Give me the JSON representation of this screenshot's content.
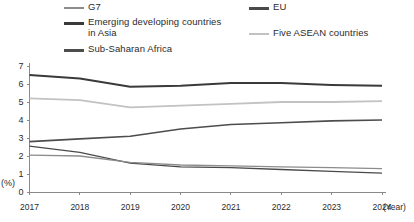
{
  "legend": {
    "items": [
      {
        "key": "g7",
        "label": "G7",
        "color": "#8c8c8c",
        "weight": "thin"
      },
      {
        "key": "asia",
        "label": "Emerging developing countries\nin Asia",
        "color": "#3a3a3a",
        "weight": "thick"
      },
      {
        "key": "ssa",
        "label": "Sub-Saharan Africa",
        "color": "#4d4d4d",
        "weight": "thick"
      },
      {
        "key": "eu",
        "label": "EU",
        "color": "#4a4a4a",
        "weight": "thin"
      },
      {
        "key": "asean",
        "label": "Five ASEAN countries",
        "color": "#c2c2c2",
        "weight": "thin"
      }
    ],
    "g7_label": "G7",
    "asia_label": "Emerging developing countries in Asia",
    "asia_label_line1": "Emerging developing countries",
    "asia_label_line2": "in Asia",
    "ssa_label": "Sub-Saharan Africa",
    "eu_label": "EU",
    "asean_label": "Five ASEAN countries"
  },
  "axes": {
    "y_title": "(%)",
    "x_title": "(Year)",
    "y_ticks": [
      "0",
      "1",
      "2",
      "3",
      "4",
      "5",
      "6",
      "7"
    ],
    "x_ticks": [
      "2017",
      "2018",
      "2019",
      "2020",
      "2021",
      "2022",
      "2023",
      "2024"
    ]
  },
  "colors": {
    "axis": "#8a8a8a",
    "text": "#2b2b2b",
    "background": "#ffffff"
  },
  "chart_data": {
    "type": "line",
    "title": "",
    "subtitle": "",
    "xlabel": "(Year)",
    "ylabel": "(%)",
    "x": [
      2017,
      2018,
      2019,
      2020,
      2021,
      2022,
      2023,
      2024
    ],
    "categories": [
      "2017",
      "2018",
      "2019",
      "2020",
      "2021",
      "2022",
      "2023",
      "2024"
    ],
    "xlim": [
      2017,
      2024
    ],
    "ylim": [
      0,
      7
    ],
    "ytick_step": 1,
    "grid": false,
    "legend_position": "top",
    "series": [
      {
        "name": "Emerging developing countries in Asia",
        "color": "#3a3a3a",
        "width": 2.0,
        "values": [
          6.5,
          6.3,
          5.85,
          5.9,
          6.05,
          6.05,
          5.95,
          5.9
        ]
      },
      {
        "name": "Five ASEAN countries",
        "color": "#c2c2c2",
        "width": 1.8,
        "values": [
          5.2,
          5.1,
          4.7,
          4.8,
          4.9,
          5.0,
          5.0,
          5.05
        ]
      },
      {
        "name": "Sub-Saharan Africa",
        "color": "#4d4d4d",
        "width": 1.6,
        "values": [
          2.8,
          2.95,
          3.1,
          3.5,
          3.75,
          3.85,
          3.95,
          4.0
        ]
      },
      {
        "name": "EU",
        "color": "#4a4a4a",
        "width": 1.3,
        "values": [
          2.55,
          2.2,
          1.6,
          1.4,
          1.35,
          1.25,
          1.15,
          1.05
        ]
      },
      {
        "name": "G7",
        "color": "#8c8c8c",
        "width": 1.3,
        "values": [
          2.05,
          2.0,
          1.65,
          1.5,
          1.45,
          1.4,
          1.35,
          1.3
        ]
      }
    ]
  }
}
